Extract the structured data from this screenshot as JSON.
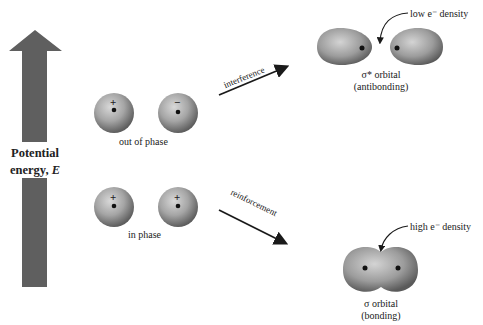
{
  "axis": {
    "label_line1": "Potential",
    "label_line2": "energy, ",
    "label_symbol": "E",
    "arrow_color": "#5f5f5f"
  },
  "atomic_orbitals": {
    "out_of_phase": {
      "label": "out of phase",
      "signs": [
        "+",
        "−"
      ]
    },
    "in_phase": {
      "label": "in phase",
      "signs": [
        "+",
        "+"
      ]
    }
  },
  "transitions": {
    "interference": "interference",
    "reinforcement": "reinforcement"
  },
  "molecular_orbitals": {
    "antibonding": {
      "name": "σ* orbital",
      "type": "(antibonding)",
      "annotation": "low e⁻ density"
    },
    "bonding": {
      "name": "σ orbital",
      "type": "(bonding)",
      "annotation": "high e⁻ density"
    }
  },
  "colors": {
    "sphere_light": "#c9c9c9",
    "sphere_dark": "#6a6a6a",
    "nucleus": "#111111"
  }
}
